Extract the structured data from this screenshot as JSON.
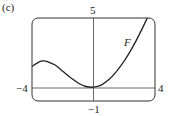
{
  "panel_label": "(c)",
  "chart_data": {
    "type": "line",
    "title": "",
    "xlabel": "",
    "ylabel": "",
    "xlim": [
      -4,
      4
    ],
    "ylim": [
      -1,
      5
    ],
    "grid": false,
    "tick_labels": {
      "x_min": "−4",
      "x_max": "4",
      "y_max": "5",
      "y_min": "−1"
    },
    "series": [
      {
        "name": "F",
        "x": [
          -4,
          -3.5,
          -3.25,
          -3,
          -2.5,
          -2,
          -1.5,
          -1,
          -0.5,
          0,
          0.5,
          1,
          1.5,
          2,
          2.5,
          3,
          3.5
        ],
        "y": [
          1.5,
          1.85,
          1.9,
          1.85,
          1.6,
          1.15,
          0.7,
          0.3,
          0.05,
          0,
          0.15,
          0.55,
          1.15,
          1.9,
          2.8,
          3.85,
          5.0
        ]
      }
    ],
    "annotations": [
      {
        "text": "F",
        "x": 2.4,
        "y": 3.5
      }
    ]
  }
}
